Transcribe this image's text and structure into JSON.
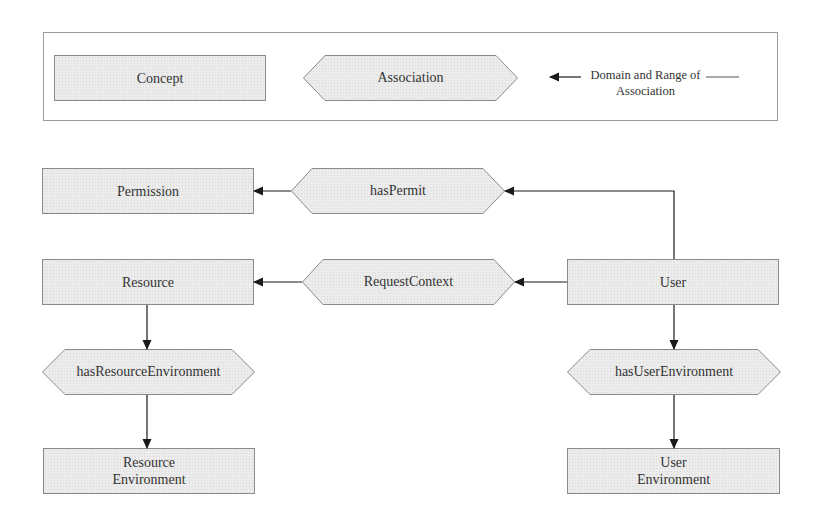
{
  "legend": {
    "concept_label": "Concept",
    "association_label": "Association",
    "arrow_label_line1": "Domain and Range of",
    "arrow_label_line2": "Association"
  },
  "concepts": {
    "permission": "Permission",
    "resource": "Resource",
    "user": "User",
    "resource_environment_line1": "Resource",
    "resource_environment_line2": "Environment",
    "user_environment_line1": "User",
    "user_environment_line2": "Environment"
  },
  "associations": {
    "has_permit": "hasPermit",
    "request_context": "RequestContext",
    "has_resource_environment": "hasResourceEnvironment",
    "has_user_environment": "hasUserEnvironment"
  },
  "colors": {
    "fill": "#ececec",
    "border": "#8a8a8a",
    "arrow": "#1a1a1a",
    "legend_border": "#9a9a9a"
  }
}
